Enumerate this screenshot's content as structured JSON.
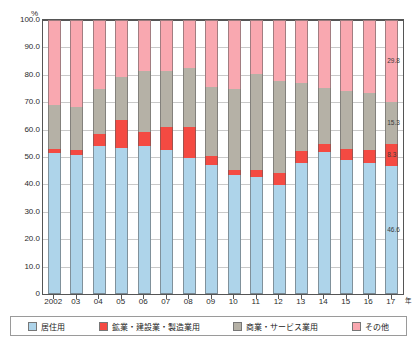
{
  "chart_data": {
    "type": "bar",
    "subtype": "stacked-percentage-column",
    "title": "",
    "xlabel": "年",
    "ylabel": "%",
    "ylim": [
      0,
      100
    ],
    "yticks": [
      "0",
      "10.0",
      "20.0",
      "30.0",
      "40.0",
      "50.0",
      "60.0",
      "70.0",
      "80.0",
      "90.0",
      "100.0"
    ],
    "ytick_values": [
      0,
      10,
      20,
      30,
      40,
      50,
      60,
      70,
      80,
      90,
      100
    ],
    "grid": true,
    "legend_position": "bottom",
    "categories": [
      "2002",
      "03",
      "04",
      "05",
      "06",
      "07",
      "08",
      "09",
      "10",
      "11",
      "12",
      "13",
      "14",
      "15",
      "16",
      "17"
    ],
    "series": [
      {
        "name": "居住用",
        "color": "#aed4ea",
        "values": [
          51.4,
          50.7,
          54.0,
          53.2,
          54.0,
          52.7,
          49.7,
          47.2,
          43.5,
          42.6,
          39.9,
          47.7,
          51.8,
          48.8,
          47.9,
          46.6
        ]
      },
      {
        "name": "鉱業・建設業・製造業用",
        "color": "#f44a42",
        "values": [
          1.5,
          1.8,
          4.4,
          10.4,
          5.0,
          8.2,
          11.2,
          3.1,
          1.8,
          2.6,
          4.4,
          4.4,
          2.9,
          4.3,
          4.5,
          8.3
        ]
      },
      {
        "name": "商業・サービス業用",
        "color": "#b5b1a6",
        "values": [
          16.0,
          15.9,
          16.3,
          15.7,
          22.3,
          20.5,
          21.4,
          25.4,
          29.6,
          35.0,
          33.4,
          25.0,
          20.5,
          21.1,
          21.1,
          15.3
        ]
      },
      {
        "name": "その他",
        "color": "#f9a8b0",
        "values": [
          31.1,
          31.6,
          25.3,
          20.7,
          18.7,
          18.6,
          17.7,
          24.3,
          25.1,
          19.8,
          22.3,
          22.9,
          24.8,
          25.8,
          26.5,
          29.8
        ]
      }
    ],
    "value_labels": {
      "bar": "17",
      "labels": [
        {
          "series": "その他",
          "text": "29.8"
        },
        {
          "series": "商業・サービス業用",
          "text": "15.3"
        },
        {
          "series": "鉱業・建設業・製造業用",
          "text": "8.3"
        },
        {
          "series": "居住用",
          "text": "46.6"
        }
      ]
    }
  },
  "legend": {
    "items": [
      {
        "label": "居住用",
        "color": "#aed4ea"
      },
      {
        "label": "鉱業・建設業・製造業用",
        "color": "#f44a42"
      },
      {
        "label": "商業・サービス業用",
        "color": "#b5b1a6"
      },
      {
        "label": "その他",
        "color": "#f9a8b0"
      }
    ]
  },
  "axis": {
    "y_unit": "%",
    "x_unit": "年"
  }
}
